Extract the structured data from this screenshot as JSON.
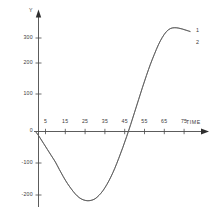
{
  "chart_data": {
    "type": "line",
    "title": "",
    "subtitle": "",
    "xlabel": "TIME",
    "ylabel": "Y",
    "xlim": [
      0,
      80
    ],
    "ylim": [
      -250,
      380
    ],
    "grid": false,
    "legend_position": "inline-right-end",
    "x_ticks": [
      5,
      15,
      25,
      35,
      45,
      55,
      65,
      75
    ],
    "x_tick_labels": [
      "5",
      "15",
      "25",
      "35",
      "45",
      "55",
      "65",
      "75"
    ],
    "y_ticks": [
      300,
      200,
      100,
      0,
      -100,
      -200
    ],
    "y_tick_labels": [
      "300",
      "200",
      "100",
      "0",
      "-100",
      "-200"
    ],
    "annotations": [
      {
        "text": "1",
        "x": 78,
        "y": 330
      },
      {
        "text": "2",
        "x": 78,
        "y": 285
      }
    ],
    "series": [
      {
        "name": "1",
        "color": "#5a5a5a",
        "x": [
          0,
          2,
          4,
          6,
          8,
          10,
          12,
          14,
          16,
          18,
          20,
          22,
          24,
          26,
          28,
          30,
          32,
          34,
          36,
          38,
          40,
          42,
          44,
          46,
          48,
          50,
          52,
          54,
          56,
          58,
          60,
          62,
          64,
          66,
          68,
          70,
          72,
          74,
          76,
          78
        ],
        "values": [
          0,
          -18,
          -38,
          -58,
          -78,
          -98,
          -122,
          -145,
          -166,
          -184,
          -200,
          -212,
          -219,
          -222,
          -221,
          -216,
          -205,
          -190,
          -170,
          -146,
          -118,
          -86,
          -52,
          -16,
          22,
          62,
          102,
          142,
          180,
          216,
          248,
          278,
          302,
          320,
          330,
          333,
          332,
          329,
          325,
          321
        ]
      },
      {
        "name": "2",
        "color": "#5a5a5a",
        "x": [
          0,
          2,
          4,
          6,
          8,
          10,
          12,
          14,
          16,
          18,
          20,
          22,
          24,
          26,
          28,
          30,
          32,
          34,
          36,
          38,
          40,
          42,
          44,
          46,
          48,
          50,
          52,
          54,
          56,
          58,
          60,
          62,
          64,
          66,
          68,
          70,
          72,
          74,
          76,
          78
        ],
        "values": [
          0,
          -18,
          -38,
          -58,
          -78,
          -98,
          -122,
          -145,
          -166,
          -184,
          -200,
          -212,
          -219,
          -222,
          -221,
          -216,
          -205,
          -190,
          -170,
          -146,
          -118,
          -86,
          -52,
          -16,
          22,
          62,
          102,
          142,
          180,
          216,
          248,
          278,
          302,
          320,
          330,
          333,
          332,
          329,
          325,
          321
        ]
      }
    ],
    "axis_color": "#4a4a4a",
    "curve_color": "#5a5a5a",
    "background": "#ffffff"
  }
}
